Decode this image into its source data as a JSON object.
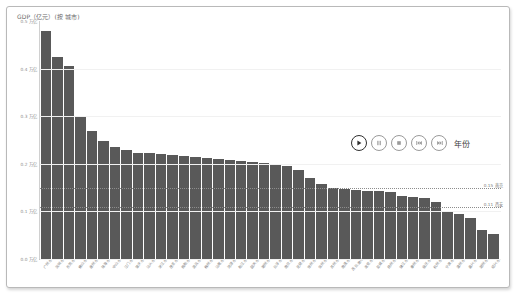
{
  "chart_data": {
    "type": "bar",
    "title": "GDP（亿元）(按 城市)",
    "xlabel": "",
    "ylabel": "",
    "ylim": [
      0,
      0.5
    ],
    "grid": true,
    "y_ticks": [
      {
        "value": 0.5,
        "label": "0.5 万亿"
      },
      {
        "value": 0.4,
        "label": "0.4 万亿"
      },
      {
        "value": 0.3,
        "label": "0.3 万亿"
      },
      {
        "value": 0.2,
        "label": "0.2 万亿"
      },
      {
        "value": 0.1,
        "label": "0.1 万亿"
      },
      {
        "value": 0.0,
        "label": "0.0 万亿"
      }
    ],
    "categories": [
      "广州市",
      "深圳市",
      "东莞市",
      "佛山市",
      "惠州市",
      "珠海市",
      "中山市",
      "江门市",
      "肇庆市",
      "汕头市",
      "湛江市",
      "茂名市",
      "揭阳市",
      "清远市",
      "梅州市",
      "汕尾市",
      "河源市",
      "阳江市",
      "韶关市",
      "潮州市",
      "云浮市",
      "南京市",
      "无锡市",
      "徐州市",
      "常州市",
      "苏州市",
      "南通市",
      "连云港市",
      "淮安市",
      "盐城市",
      "扬州市",
      "镇江市",
      "泰州市",
      "宿迁市",
      "杭州市",
      "宁波市",
      "温州市",
      "嘉兴市",
      "湖州市",
      "绍兴市"
    ],
    "values": [
      0.48,
      0.425,
      0.405,
      0.3,
      0.268,
      0.248,
      0.235,
      0.23,
      0.222,
      0.222,
      0.22,
      0.218,
      0.216,
      0.214,
      0.212,
      0.21,
      0.208,
      0.206,
      0.204,
      0.202,
      0.2,
      0.196,
      0.186,
      0.17,
      0.158,
      0.15,
      0.148,
      0.144,
      0.142,
      0.142,
      0.14,
      0.133,
      0.13,
      0.128,
      0.12,
      0.1,
      0.095,
      0.086,
      0.06,
      0.052
    ],
    "reference_lines": [
      {
        "value": 0.15,
        "label": "0.15 南京"
      },
      {
        "value": 0.11,
        "label": "0.11 西安"
      }
    ]
  },
  "playback": {
    "label": "年份",
    "buttons": [
      {
        "name": "play",
        "title": "播放"
      },
      {
        "name": "pause",
        "title": "暂停"
      },
      {
        "name": "stop",
        "title": "停止"
      },
      {
        "name": "prev",
        "title": "上一帧"
      },
      {
        "name": "next",
        "title": "下一帧"
      }
    ]
  },
  "colors": {
    "bar": "#595959",
    "axis": "#c3c3c3",
    "grid": "#f1f1f1",
    "reference": "#8d8d8d",
    "text": "#7d7d7d"
  }
}
